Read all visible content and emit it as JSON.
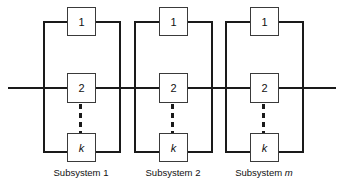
{
  "figure": {
    "type": "reliability-block-diagram",
    "background_color": "#ffffff",
    "line_color": "#1a1a1a",
    "box_border_color": "#3a3a3a"
  },
  "subsystems": [
    {
      "caption_prefix": "Subsystem",
      "caption_index": "1",
      "caption_italic": false,
      "blocks": [
        {
          "label": "1",
          "italic": false
        },
        {
          "label": "2",
          "italic": false
        },
        {
          "label": "k",
          "italic": true
        }
      ],
      "ellipsis": "vertical-dashed"
    },
    {
      "caption_prefix": "Subsystem",
      "caption_index": "2",
      "caption_italic": false,
      "blocks": [
        {
          "label": "1",
          "italic": false
        },
        {
          "label": "2",
          "italic": false
        },
        {
          "label": "k",
          "italic": true
        }
      ],
      "ellipsis": "vertical-dashed"
    },
    {
      "caption_prefix": "Subsystem",
      "caption_index": "m",
      "caption_italic": true,
      "blocks": [
        {
          "label": "1",
          "italic": false
        },
        {
          "label": "2",
          "italic": false
        },
        {
          "label": "k",
          "italic": true
        }
      ],
      "ellipsis": "vertical-dashed"
    }
  ]
}
